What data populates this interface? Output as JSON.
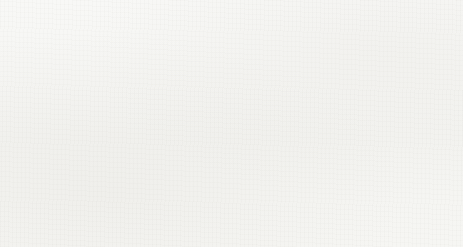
{
  "figure": {
    "background_color": "#f7f7f5",
    "outline_color": "#2e2e2e",
    "cation_color": "#fdfdfc",
    "anion_color": "#c9c9c6"
  },
  "panels": [
    {
      "id": "a",
      "caption": "(a)",
      "representation": "labelled-cross-section",
      "rows": 6,
      "columns": 6,
      "grid": [
        [
          "Na",
          "Cl",
          "Na",
          "Cl",
          "Na",
          "Cl"
        ],
        [
          "Cl",
          "Na",
          "Cl",
          "Na",
          "Cl",
          "Na"
        ],
        [
          "Na",
          "Cl",
          "Na",
          "Cl",
          "Na",
          "Cl"
        ],
        [
          "Cl",
          "Na",
          "Cl",
          "Na",
          "Cl",
          "Na"
        ],
        [
          "Na",
          "Cl",
          "Na",
          "Cl",
          "Na",
          "Cl"
        ],
        [
          "Cl",
          "Na",
          "Cl",
          "Na",
          "Cl",
          "Na"
        ]
      ]
    },
    {
      "id": "b",
      "caption": "(b)",
      "representation": "space-filling-crystal",
      "front_rows": 7,
      "front_columns": 7,
      "depth_layers": 4
    }
  ],
  "ions": {
    "sodium": {
      "symbol": "Na",
      "charge": "+",
      "label": "Na+",
      "relative_radius": 0.68
    },
    "chloride": {
      "symbol": "Cl",
      "charge": "−",
      "label": "Cl−",
      "relative_radius": 1.0
    }
  }
}
